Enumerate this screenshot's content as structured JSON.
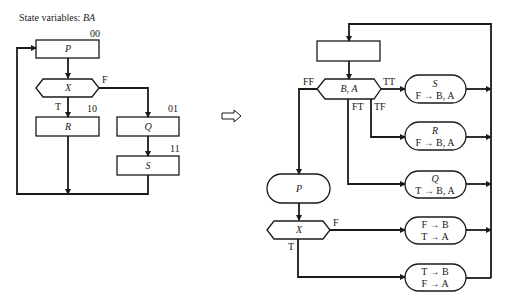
{
  "header": {
    "state_label": "State variables:",
    "state_vars": "BA"
  },
  "left_flowchart": {
    "nodes": {
      "P": {
        "label": "P",
        "state": "00",
        "shape": "rectangle"
      },
      "X": {
        "label": "X",
        "shape": "hexagon-decision"
      },
      "R": {
        "label": "R",
        "state": "10",
        "shape": "rectangle"
      },
      "Q": {
        "label": "Q",
        "state": "01",
        "shape": "rectangle"
      },
      "S": {
        "label": "S",
        "state": "11",
        "shape": "rectangle"
      }
    },
    "edge_labels": {
      "x_true": "T",
      "x_false": "F"
    }
  },
  "transform_arrow": {
    "icon": "hollow-right-arrow-icon"
  },
  "right_flowchart": {
    "entry_box": {
      "label": ""
    },
    "decision": {
      "label": "B, A"
    },
    "branches": {
      "tt": "TT",
      "ft": "FT",
      "tf": "TF",
      "ff": "FF"
    },
    "action_S": {
      "title": "S",
      "assign": "F → B, A"
    },
    "action_R": {
      "title": "R",
      "assign": "F → B, A"
    },
    "action_Q": {
      "title": "Q",
      "assign": "T → B, A"
    },
    "action_P": {
      "title": "P"
    },
    "decision_X": {
      "label": "X",
      "true_label": "T",
      "false_label": "F"
    },
    "assign_false": {
      "line1": "F → B",
      "line2": "T → A"
    },
    "assign_true": {
      "line1": "T → B",
      "line2": "F → A"
    }
  },
  "colors": {
    "ink": "#1a1a1a",
    "background": "#ffffff"
  }
}
